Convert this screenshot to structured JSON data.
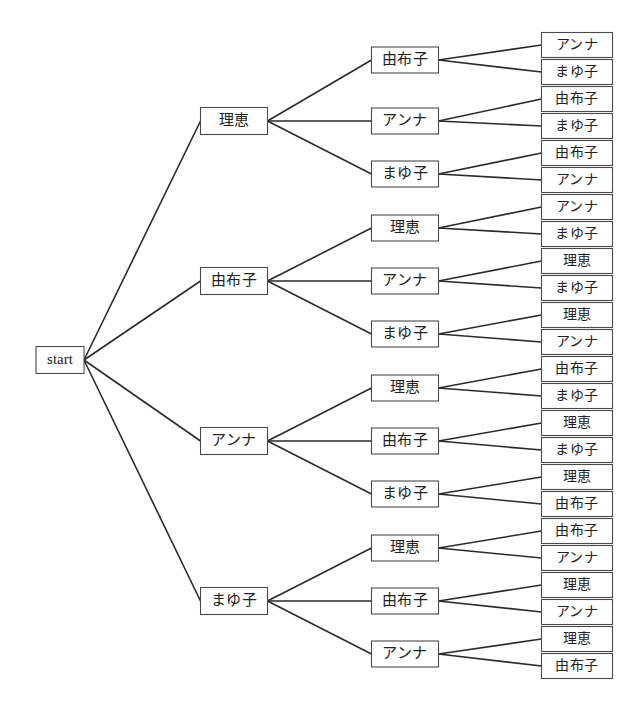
{
  "diagram": {
    "type": "tree",
    "title": "",
    "root": {
      "label": "start",
      "x": 60,
      "y": 360,
      "w": 48,
      "h": 27
    },
    "names": [
      "理恵",
      "由布子",
      "アンナ",
      "まゆ子"
    ],
    "geometry": {
      "level1_x": 234,
      "level1_w": 67,
      "level1_h": 27,
      "level2_x": 405,
      "level2_w": 67,
      "level2_h": 26,
      "leaf_x": 577,
      "leaf_w": 71,
      "leaf_h": 25
    },
    "branches": [
      {
        "label": "理恵",
        "y": 121,
        "children": [
          {
            "label": "由布子",
            "y": 60,
            "leaves": [
              {
                "label": "アンナ",
                "y": 45
              },
              {
                "label": "まゆ子",
                "y": 72
              }
            ]
          },
          {
            "label": "アンナ",
            "y": 121,
            "leaves": [
              {
                "label": "由布子",
                "y": 99
              },
              {
                "label": "まゆ子",
                "y": 126
              }
            ]
          },
          {
            "label": "まゆ子",
            "y": 174,
            "leaves": [
              {
                "label": "由布子",
                "y": 153
              },
              {
                "label": "アンナ",
                "y": 180
              }
            ]
          }
        ]
      },
      {
        "label": "由布子",
        "y": 281,
        "children": [
          {
            "label": "理恵",
            "y": 228,
            "leaves": [
              {
                "label": "アンナ",
                "y": 207
              },
              {
                "label": "まゆ子",
                "y": 234
              }
            ]
          },
          {
            "label": "アンナ",
            "y": 281,
            "leaves": [
              {
                "label": "理恵",
                "y": 261
              },
              {
                "label": "まゆ子",
                "y": 288
              }
            ]
          },
          {
            "label": "まゆ子",
            "y": 334,
            "leaves": [
              {
                "label": "理恵",
                "y": 315
              },
              {
                "label": "アンナ",
                "y": 342
              }
            ]
          }
        ]
      },
      {
        "label": "アンナ",
        "y": 441,
        "children": [
          {
            "label": "理恵",
            "y": 388,
            "leaves": [
              {
                "label": "由布子",
                "y": 369
              },
              {
                "label": "まゆ子",
                "y": 396
              }
            ]
          },
          {
            "label": "由布子",
            "y": 441,
            "leaves": [
              {
                "label": "理恵",
                "y": 423
              },
              {
                "label": "まゆ子",
                "y": 450
              }
            ]
          },
          {
            "label": "まゆ子",
            "y": 494,
            "leaves": [
              {
                "label": "理恵",
                "y": 477
              },
              {
                "label": "由布子",
                "y": 504
              }
            ]
          }
        ]
      },
      {
        "label": "まゆ子",
        "y": 601,
        "children": [
          {
            "label": "理恵",
            "y": 548,
            "leaves": [
              {
                "label": "由布子",
                "y": 531
              },
              {
                "label": "アンナ",
                "y": 558
              }
            ]
          },
          {
            "label": "由布子",
            "y": 601,
            "leaves": [
              {
                "label": "理恵",
                "y": 585
              },
              {
                "label": "アンナ",
                "y": 612
              }
            ]
          },
          {
            "label": "アンナ",
            "y": 654,
            "leaves": [
              {
                "label": "理恵",
                "y": 639
              },
              {
                "label": "由布子",
                "y": 666
              }
            ]
          }
        ]
      }
    ],
    "colors": {
      "background": "#ffffff",
      "edge": "#2b2b2b",
      "box_stroke": "#4a4a4a",
      "box_fill": "#ffffff",
      "text": "#222222"
    }
  }
}
